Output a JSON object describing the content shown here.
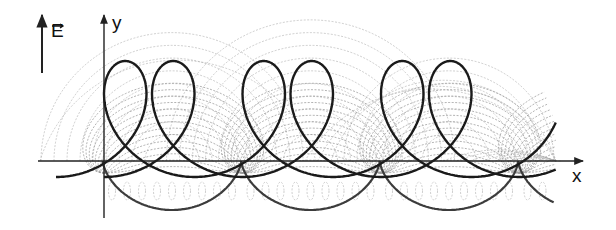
{
  "figure": {
    "labels": {
      "field_vector": "E",
      "y_axis": "y",
      "x_axis": "x"
    },
    "colors": {
      "axis": "#222222",
      "thick_curve": "#1a1a1a",
      "envelope_curve": "#3c3c3c",
      "family_curves": "#9a9a9a"
    },
    "geometry": {
      "origin": [
        104,
        161
      ],
      "x_axis": {
        "from": 38,
        "to": 583,
        "y": 161
      },
      "y_axis": {
        "x": 104,
        "from": 218,
        "to": 15
      },
      "field_arrow": {
        "x": 42,
        "from": 73,
        "to": 15
      },
      "period_px": 138.5,
      "cycloid_envelope": {
        "cusp_depth_px": 49,
        "cusps_x": [
          172,
          311,
          449
        ]
      },
      "trajectories": [
        {
          "name": "trajectory-1",
          "start_x": 56,
          "rx": 51,
          "ry": 58,
          "base_y": 177
        },
        {
          "name": "trajectory-2",
          "start_x": 104,
          "rx": 51,
          "ry": 58,
          "base_y": 177
        }
      ],
      "family": {
        "count": 14,
        "max_radius_px": 68
      }
    }
  }
}
